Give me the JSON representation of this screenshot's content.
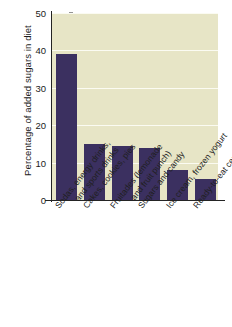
{
  "chart_data": {
    "type": "bar",
    "title": "",
    "xlabel": "",
    "ylabel": "Percentage of added sugars in diet",
    "ylim": [
      0,
      50
    ],
    "yticks": [
      0,
      10,
      20,
      30,
      40,
      50
    ],
    "ytick_labels": [
      "0",
      "10",
      "20",
      "30",
      "40",
      "50"
    ],
    "grid": true,
    "legend": false,
    "bar_color": "#3b3060",
    "plot_background": "#e7e5c6",
    "figure_background": "#ffffff",
    "categories": [
      "Sodas, energy drinks, and sports drinks",
      "Cakes, cookies, pies",
      "Fruitades (lemonade and fruit punch)",
      "Sugars and candy",
      "Ice cream, frozen yogurt",
      "Ready-to-eat cereals"
    ],
    "category_lines": [
      [
        "Sodas, energy drinks,",
        "and sports drinks"
      ],
      [
        "Cakes, cookies, pies",
        ""
      ],
      [
        "Fruitades (lemonade",
        "and fruit punch)"
      ],
      [
        "Sugars and candy",
        ""
      ],
      [
        "Ice cream, frozen yogurt",
        ""
      ],
      [
        "Ready-to-eat cereals",
        ""
      ]
    ],
    "values": [
      39,
      15,
      14.5,
      14,
      8,
      5.5
    ]
  }
}
